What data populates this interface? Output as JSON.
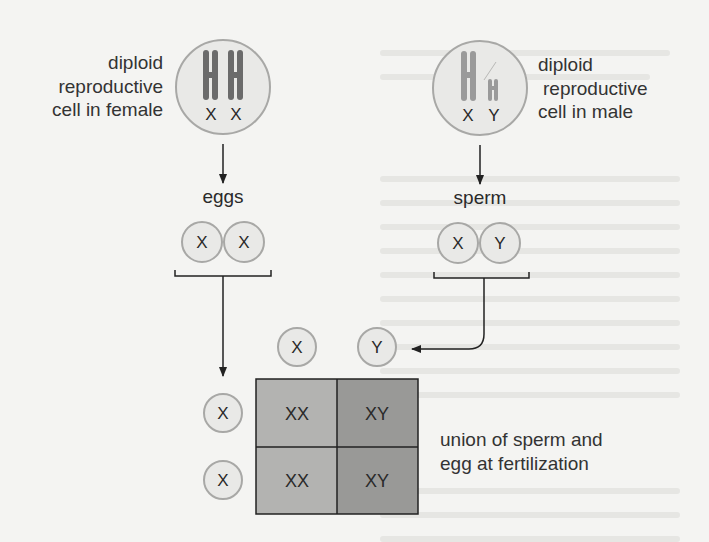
{
  "female": {
    "label_lines": [
      "diploid",
      "reproductive",
      "cell in female"
    ],
    "chromosomes": [
      "X",
      "X"
    ]
  },
  "male": {
    "label_lines": [
      "diploid",
      "reproductive",
      "cell in male"
    ],
    "chromosomes": [
      "X",
      "Y"
    ]
  },
  "gametes": {
    "eggs_label": "eggs",
    "eggs": [
      "X",
      "X"
    ],
    "sperm_label": "sperm",
    "sperm": [
      "X",
      "Y"
    ]
  },
  "punnett": {
    "column_headers": [
      "X",
      "Y"
    ],
    "row_headers": [
      "X",
      "X"
    ],
    "cells": [
      [
        "XX",
        "XY"
      ],
      [
        "XX",
        "XY"
      ]
    ],
    "caption_lines": [
      "union of sperm and",
      "egg at fertilization"
    ]
  },
  "colors": {
    "background": "#f4f4f2",
    "cell_fill": "#e9e9e7",
    "cell_stroke": "#a8a8a6",
    "chromosome_female": "#6b6b6b",
    "chromosome_male": "#9a9a9a",
    "grid_xx": "#b3b3b1",
    "grid_xy": "#999997",
    "line": "#222222"
  }
}
